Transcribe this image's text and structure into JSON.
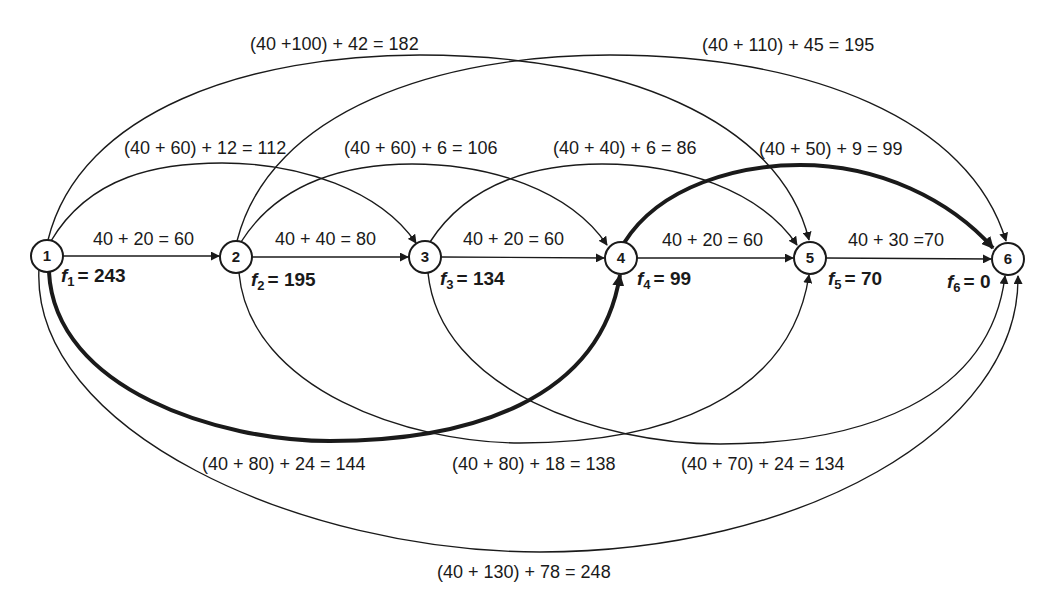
{
  "diagram": {
    "type": "directed-network",
    "nodes": [
      {
        "id": "1",
        "label": "1",
        "x": 47,
        "y": 256,
        "f_label": "1",
        "f_value": "= 243"
      },
      {
        "id": "2",
        "label": "2",
        "x": 236,
        "y": 257,
        "f_label": "2",
        "f_value": "= 195"
      },
      {
        "id": "3",
        "label": "3",
        "x": 425,
        "y": 257,
        "f_label": "3",
        "f_value": "= 134"
      },
      {
        "id": "4",
        "label": "4",
        "x": 621,
        "y": 258,
        "f_label": "4",
        "f_value": "= 99"
      },
      {
        "id": "5",
        "label": "5",
        "x": 810,
        "y": 258,
        "f_label": "5",
        "f_value": "= 70"
      },
      {
        "id": "6",
        "label": "6",
        "x": 1008,
        "y": 259,
        "f_label": "6",
        "f_value": "= 0"
      }
    ],
    "f_prefix": "f",
    "edges": [
      {
        "from": "1",
        "to": "2",
        "label": "40 + 20 = 60",
        "optimal": false
      },
      {
        "from": "2",
        "to": "3",
        "label": "40 + 40 = 80",
        "optimal": false
      },
      {
        "from": "3",
        "to": "4",
        "label": "40 + 20 = 60",
        "optimal": false
      },
      {
        "from": "4",
        "to": "5",
        "label": "40 + 20 = 60",
        "optimal": false
      },
      {
        "from": "5",
        "to": "6",
        "label": "40 + 30 =70",
        "optimal": false
      },
      {
        "from": "1",
        "to": "3",
        "label": "(40 + 60) + 12 = 112",
        "optimal": false
      },
      {
        "from": "2",
        "to": "4",
        "label": "(40 + 60) + 6 = 106",
        "optimal": false
      },
      {
        "from": "3",
        "to": "5",
        "label": "(40 + 40) + 6 = 86",
        "optimal": false
      },
      {
        "from": "4",
        "to": "6",
        "label": "(40 + 50) + 9 = 99",
        "optimal": true
      },
      {
        "from": "1",
        "to": "5",
        "label": "(40 +100) + 42 = 182",
        "optimal": false
      },
      {
        "from": "2",
        "to": "6",
        "label": "(40 + 110) + 45 = 195",
        "optimal": false
      },
      {
        "from": "1",
        "to": "4",
        "label": "(40 + 80) + 24 = 144",
        "optimal": true
      },
      {
        "from": "2",
        "to": "5",
        "label": "(40 + 80) + 18 = 138",
        "optimal": false
      },
      {
        "from": "3",
        "to": "6",
        "label": "(40 + 70) + 24 = 134",
        "optimal": false
      },
      {
        "from": "1",
        "to": "6",
        "label": "(40 + 130) + 78 = 248",
        "optimal": false
      }
    ],
    "colors": {
      "stroke": "#1a1a1a",
      "background": "#ffffff"
    }
  }
}
